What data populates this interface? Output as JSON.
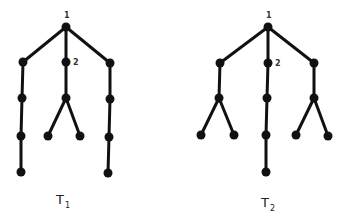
{
  "colors": {
    "ink": "#111111",
    "background": "#ffffff"
  },
  "trees": [
    {
      "name": "T1",
      "label": "T",
      "subscript": "1",
      "label_pos": [
        56,
        204
      ],
      "nodes": [
        {
          "id": "r",
          "x": 66,
          "y": 27,
          "label": "1"
        },
        {
          "id": "a1",
          "x": 23,
          "y": 62
        },
        {
          "id": "b1",
          "x": 66,
          "y": 62,
          "label": "2"
        },
        {
          "id": "c1",
          "x": 110,
          "y": 63
        },
        {
          "id": "a2",
          "x": 22,
          "y": 98
        },
        {
          "id": "b2",
          "x": 66,
          "y": 98
        },
        {
          "id": "c2",
          "x": 110,
          "y": 99
        },
        {
          "id": "a3",
          "x": 21,
          "y": 136
        },
        {
          "id": "b3l",
          "x": 48,
          "y": 136
        },
        {
          "id": "b3r",
          "x": 80,
          "y": 136
        },
        {
          "id": "c3",
          "x": 109,
          "y": 137
        },
        {
          "id": "a4",
          "x": 21,
          "y": 172
        },
        {
          "id": "c4",
          "x": 108,
          "y": 173
        }
      ],
      "edges": [
        [
          "r",
          "a1"
        ],
        [
          "r",
          "b1"
        ],
        [
          "r",
          "c1"
        ],
        [
          "a1",
          "a2"
        ],
        [
          "a2",
          "a3"
        ],
        [
          "a3",
          "a4"
        ],
        [
          "b1",
          "b2"
        ],
        [
          "b2",
          "b3l"
        ],
        [
          "b2",
          "b3r"
        ],
        [
          "c1",
          "c2"
        ],
        [
          "c2",
          "c3"
        ],
        [
          "c3",
          "c4"
        ]
      ]
    },
    {
      "name": "T2",
      "label": "T",
      "subscript": "2",
      "label_pos": [
        261,
        207
      ],
      "nodes": [
        {
          "id": "r",
          "x": 268,
          "y": 27,
          "label": "1"
        },
        {
          "id": "a1",
          "x": 220,
          "y": 63
        },
        {
          "id": "b1",
          "x": 268,
          "y": 63,
          "label": "2"
        },
        {
          "id": "c1",
          "x": 314,
          "y": 63
        },
        {
          "id": "a2",
          "x": 219,
          "y": 98
        },
        {
          "id": "b2",
          "x": 267,
          "y": 98
        },
        {
          "id": "c2",
          "x": 314,
          "y": 98
        },
        {
          "id": "a3l",
          "x": 201,
          "y": 135
        },
        {
          "id": "a3r",
          "x": 234,
          "y": 135
        },
        {
          "id": "b3",
          "x": 266,
          "y": 135
        },
        {
          "id": "c3l",
          "x": 296,
          "y": 135
        },
        {
          "id": "c3r",
          "x": 328,
          "y": 136
        },
        {
          "id": "b4",
          "x": 266,
          "y": 172
        }
      ],
      "edges": [
        [
          "r",
          "a1"
        ],
        [
          "r",
          "b1"
        ],
        [
          "r",
          "c1"
        ],
        [
          "a1",
          "a2"
        ],
        [
          "a2",
          "a3l"
        ],
        [
          "a2",
          "a3r"
        ],
        [
          "b1",
          "b2"
        ],
        [
          "b2",
          "b3"
        ],
        [
          "b3",
          "b4"
        ],
        [
          "c1",
          "c2"
        ],
        [
          "c2",
          "c3l"
        ],
        [
          "c2",
          "c3r"
        ]
      ]
    }
  ]
}
